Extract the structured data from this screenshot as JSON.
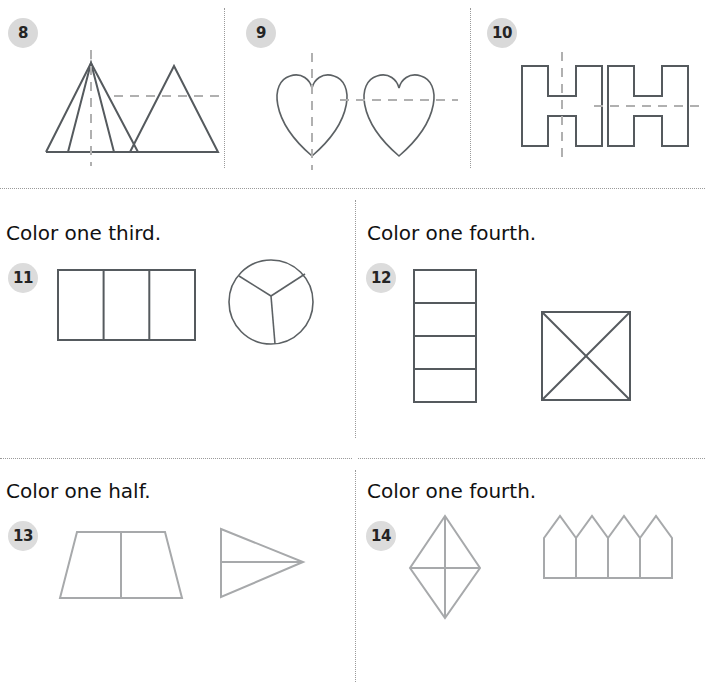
{
  "worksheet": {
    "title": "Symmetry and fractions practice page",
    "background_color": "#ffffff",
    "dark_stroke": "#555a5e",
    "light_stroke": "#a7a9ab",
    "dash_stroke": "#b0b0b0",
    "badge_bg": "#d9d9d9",
    "badge_text_color": "#242424"
  },
  "row1": {
    "items": [
      {
        "number": "8",
        "shapes": [
          "triangle-with-vertical-dashed-line",
          "triangle-with-horizontal-dashed-line"
        ]
      },
      {
        "number": "9",
        "shapes": [
          "heart-with-vertical-dashed-line",
          "heart-with-horizontal-dashed-line"
        ]
      },
      {
        "number": "10",
        "shapes": [
          "letter-h-with-vertical-dashed-line",
          "letter-h-with-horizontal-dashed-line"
        ]
      }
    ]
  },
  "row2": {
    "items": [
      {
        "number": "11",
        "prompt": "Color one third.",
        "shapes": [
          "rectangle-split-in-thirds",
          "circle-split-in-thirds"
        ]
      },
      {
        "number": "12",
        "prompt": "Color one fourth.",
        "shapes": [
          "rectangle-split-in-fourths",
          "square-split-by-diagonals"
        ]
      }
    ]
  },
  "row3": {
    "items": [
      {
        "number": "13",
        "prompt": "Color one half.",
        "shapes": [
          "trapezoid-split-in-half",
          "triangle-split-in-half"
        ]
      },
      {
        "number": "14",
        "prompt": "Color one fourth.",
        "shapes": [
          "rhombus-split-in-fourths",
          "fence-four-pickets"
        ]
      }
    ]
  }
}
